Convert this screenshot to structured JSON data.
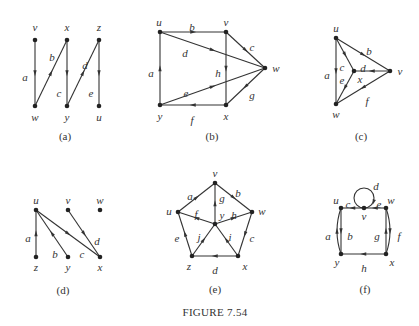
{
  "figure": {
    "title": "FIGURE 7.54",
    "diagrams": [
      {
        "id": "a",
        "caption": "(a)",
        "nodes": [
          {
            "name": "v",
            "x": 35,
            "y": 40,
            "lx": 35,
            "ly": 31
          },
          {
            "name": "x",
            "x": 67,
            "y": 40,
            "lx": 67,
            "ly": 31
          },
          {
            "name": "z",
            "x": 99,
            "y": 40,
            "lx": 99,
            "ly": 31
          },
          {
            "name": "w",
            "x": 35,
            "y": 106,
            "lx": 35,
            "ly": 121
          },
          {
            "name": "y",
            "x": 67,
            "y": 106,
            "lx": 67,
            "ly": 121
          },
          {
            "name": "u",
            "x": 99,
            "y": 106,
            "lx": 99,
            "ly": 121
          }
        ],
        "edges": [
          {
            "label": "a",
            "from": "v",
            "to": "w",
            "lx": 25,
            "ly": 77
          },
          {
            "label": "b",
            "from": "w",
            "to": "x",
            "lx": 52,
            "ly": 57
          },
          {
            "label": "c",
            "from": "x",
            "to": "y",
            "lx": 59,
            "ly": 93
          },
          {
            "label": "d",
            "from": "y",
            "to": "z",
            "lx": 85,
            "ly": 65
          },
          {
            "label": "e",
            "from": "z",
            "to": "u",
            "lx": 91,
            "ly": 93
          }
        ],
        "caption_x": 65,
        "caption_y": 140
      },
      {
        "id": "b",
        "caption": "(b)",
        "nodes": [
          {
            "name": "u",
            "x": 160,
            "y": 32,
            "lx": 159,
            "ly": 26
          },
          {
            "name": "v",
            "x": 226,
            "y": 32,
            "lx": 226,
            "ly": 26
          },
          {
            "name": "w",
            "x": 265,
            "y": 68,
            "lx": 276,
            "ly": 72
          },
          {
            "name": "y",
            "x": 160,
            "y": 105,
            "lx": 160,
            "ly": 120
          },
          {
            "name": "x",
            "x": 226,
            "y": 105,
            "lx": 226,
            "ly": 120
          }
        ],
        "edges": [
          {
            "label": "a",
            "from": "y",
            "to": "u",
            "lx": 151,
            "ly": 73
          },
          {
            "label": "b",
            "from": "u",
            "to": "v",
            "lx": 192,
            "ly": 27
          },
          {
            "label": "c",
            "from": "v",
            "to": "w",
            "lx": 252,
            "ly": 47
          },
          {
            "label": "d",
            "from": "u",
            "to": "w",
            "lx": 185,
            "ly": 53
          },
          {
            "label": "e",
            "from": "y",
            "to": "w",
            "lx": 186,
            "ly": 93
          },
          {
            "label": "f",
            "from": "x",
            "to": "y",
            "lx": 192,
            "ly": 120
          },
          {
            "label": "g",
            "from": "w",
            "to": "x",
            "lx": 252,
            "ly": 95
          },
          {
            "label": "h",
            "from": "v",
            "to": "x",
            "lx": 218,
            "ly": 73
          }
        ],
        "caption_x": 212,
        "caption_y": 140
      },
      {
        "id": "c",
        "caption": "(c)",
        "nodes": [
          {
            "name": "u",
            "x": 336,
            "y": 38,
            "lx": 336,
            "ly": 32
          },
          {
            "name": "v",
            "x": 390,
            "y": 71,
            "lx": 400,
            "ly": 75
          },
          {
            "name": "x",
            "x": 354,
            "y": 71,
            "lx": 360,
            "ly": 83
          },
          {
            "name": "w",
            "x": 336,
            "y": 104,
            "lx": 336,
            "ly": 118
          }
        ],
        "edges": [
          {
            "label": "a",
            "from": "u",
            "to": "w",
            "lx": 327,
            "ly": 75
          },
          {
            "label": "b",
            "from": "u",
            "to": "v",
            "lx": 369,
            "ly": 51
          },
          {
            "label": "c",
            "from": "u",
            "to": "x",
            "lx": 342,
            "ly": 67
          },
          {
            "label": "d",
            "from": "v",
            "to": "x",
            "lx": 363,
            "ly": 68
          },
          {
            "label": "e",
            "from": "x",
            "to": "w",
            "lx": 342,
            "ly": 80
          },
          {
            "label": "f",
            "from": "v",
            "to": "w",
            "lx": 367,
            "ly": 101
          }
        ],
        "caption_x": 361,
        "caption_y": 140
      },
      {
        "id": "d",
        "caption": "(d)",
        "nodes": [
          {
            "name": "u",
            "x": 36,
            "y": 210,
            "lx": 36,
            "ly": 204
          },
          {
            "name": "v",
            "x": 68,
            "y": 210,
            "lx": 68,
            "ly": 204
          },
          {
            "name": "w",
            "x": 100,
            "y": 210,
            "lx": 100,
            "ly": 204
          },
          {
            "name": "z",
            "x": 36,
            "y": 257,
            "lx": 36,
            "ly": 271
          },
          {
            "name": "y",
            "x": 68,
            "y": 257,
            "lx": 68,
            "ly": 271
          },
          {
            "name": "x",
            "x": 100,
            "y": 257,
            "lx": 100,
            "ly": 271
          }
        ],
        "edges": [
          {
            "label": "a",
            "from": "z",
            "to": "u",
            "lx": 28,
            "ly": 238
          },
          {
            "label": "b",
            "from": "y",
            "to": "u",
            "lx": 55,
            "ly": 254
          },
          {
            "label": "c",
            "from": "u",
            "to": "x",
            "lx": 82,
            "ly": 254
          },
          {
            "label": "d",
            "from": "v",
            "to": "x",
            "lx": 97,
            "ly": 241
          }
        ],
        "caption_x": 63,
        "caption_y": 294
      },
      {
        "id": "e",
        "caption": "(e)",
        "nodes": [
          {
            "name": "v",
            "x": 215,
            "y": 183,
            "lx": 215,
            "ly": 177
          },
          {
            "name": "u",
            "x": 178,
            "y": 212,
            "lx": 169,
            "ly": 215
          },
          {
            "name": "w",
            "x": 252,
            "y": 212,
            "lx": 262,
            "ly": 215
          },
          {
            "name": "y",
            "x": 215,
            "y": 224,
            "lx": 222,
            "ly": 219
          },
          {
            "name": "z",
            "x": 192,
            "y": 256,
            "lx": 189,
            "ly": 270
          },
          {
            "name": "x",
            "x": 238,
            "y": 256,
            "lx": 245,
            "ly": 270
          }
        ],
        "edges": [
          {
            "label": "a",
            "from": "u",
            "to": "v",
            "lx": 190,
            "ly": 196
          },
          {
            "label": "b",
            "from": "v",
            "to": "w",
            "lx": 238,
            "ly": 193
          },
          {
            "label": "c",
            "from": "w",
            "to": "x",
            "lx": 252,
            "ly": 238
          },
          {
            "label": "d",
            "from": "x",
            "to": "z",
            "lx": 215,
            "ly": 270
          },
          {
            "label": "e",
            "from": "z",
            "to": "u",
            "lx": 177,
            "ly": 238
          },
          {
            "label": "f",
            "from": "y",
            "to": "u",
            "lx": 196,
            "ly": 214
          },
          {
            "label": "g",
            "from": "y",
            "to": "v",
            "lx": 222,
            "ly": 198
          },
          {
            "label": "h",
            "from": "y",
            "to": "w",
            "lx": 234,
            "ly": 215
          },
          {
            "label": "i",
            "from": "x",
            "to": "y",
            "lx": 230,
            "ly": 237
          },
          {
            "label": "j",
            "from": "z",
            "to": "y",
            "lx": 199,
            "ly": 237
          }
        ],
        "caption_x": 215,
        "caption_y": 293
      },
      {
        "id": "f",
        "caption": "(f)",
        "nodes": [
          {
            "name": "u",
            "x": 341,
            "y": 208,
            "lx": 336,
            "ly": 204
          },
          {
            "name": "v",
            "x": 364,
            "y": 208,
            "lx": 364,
            "ly": 220
          },
          {
            "name": "w",
            "x": 386,
            "y": 208,
            "lx": 391,
            "ly": 204
          },
          {
            "name": "y",
            "x": 341,
            "y": 254,
            "lx": 337,
            "ly": 266
          },
          {
            "name": "x",
            "x": 386,
            "y": 254,
            "lx": 392,
            "ly": 266
          }
        ],
        "edges": [
          {
            "label": "a",
            "from": "y",
            "to": "u",
            "lx": 328,
            "ly": 236,
            "curved": "left"
          },
          {
            "label": "b",
            "from": "u",
            "to": "y",
            "lx": 350,
            "ly": 236
          },
          {
            "label": "c",
            "from": "v",
            "to": "u",
            "lx": 348,
            "ly": 204
          },
          {
            "label": "d",
            "from": "v",
            "to": "v",
            "lx": 376,
            "ly": 186,
            "loop": true
          },
          {
            "label": "e",
            "from": "w",
            "to": "v",
            "lx": 379,
            "ly": 204
          },
          {
            "label": "f",
            "from": "w",
            "to": "x",
            "lx": 399,
            "ly": 236,
            "curved": "right"
          },
          {
            "label": "g",
            "from": "x",
            "to": "w",
            "lx": 377,
            "ly": 236
          },
          {
            "label": "h",
            "from": "x",
            "to": "y",
            "lx": 364,
            "ly": 268
          }
        ],
        "caption_x": 365,
        "caption_y": 293
      }
    ],
    "title_x": 215,
    "title_y": 316
  }
}
